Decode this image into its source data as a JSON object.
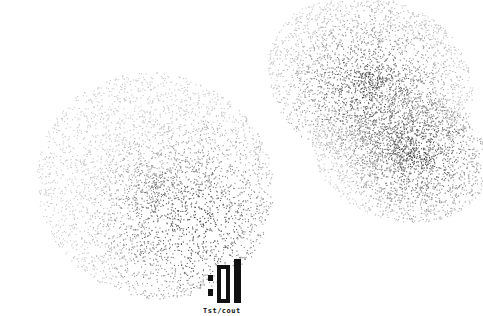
{
  "artwork": {
    "label": ":01",
    "caption": "Tst/cout",
    "background": "#ffffff",
    "ink": "#111111",
    "clouds": [
      {
        "name": "left-cloud",
        "cx": 155,
        "cy": 185,
        "rx": 120,
        "ry": 112,
        "rot": 25,
        "count": 3800,
        "dark_cx": 195,
        "dark_cy": 225,
        "highlights": [
          [
            148,
            155
          ],
          [
            162,
            222
          ],
          [
            213,
            236
          ]
        ]
      },
      {
        "name": "top-right-cloud",
        "cx": 370,
        "cy": 80,
        "rx": 105,
        "ry": 85,
        "rot": 20,
        "count": 3200,
        "dark_cx": 370,
        "dark_cy": 95,
        "highlights": [
          [
            363,
            15
          ],
          [
            385,
            90
          ]
        ]
      },
      {
        "name": "bottom-right-cloud",
        "cx": 400,
        "cy": 155,
        "rx": 90,
        "ry": 65,
        "rot": 15,
        "count": 2400,
        "dark_cx": 420,
        "dark_cy": 150,
        "highlights": [
          [
            452,
            104
          ],
          [
            360,
            152
          ]
        ]
      }
    ]
  }
}
